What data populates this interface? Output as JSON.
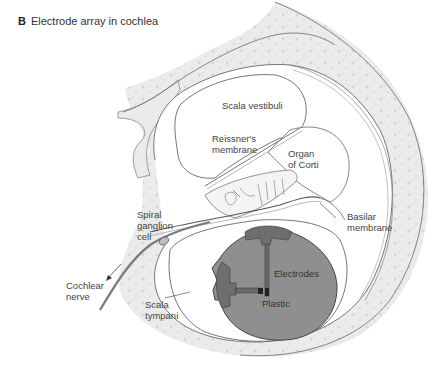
{
  "figure": {
    "panel_letter": "B",
    "title": "Electrode array in cochlea"
  },
  "labels": {
    "scala_vestibuli": "Scala vestibuli",
    "reissners_membrane_1": "Reissner's",
    "reissners_membrane_2": "membrane",
    "organ_of_corti_1": "Organ",
    "organ_of_corti_2": "of Corti",
    "spiral_ganglion_1": "Spiral",
    "spiral_ganglion_2": "ganglion",
    "spiral_ganglion_3": "cell",
    "basilar_membrane_1": "Basilar",
    "basilar_membrane_2": "membrane",
    "electrodes": "Electrodes",
    "cochlear_nerve_1": "Cochlear",
    "cochlear_nerve_2": "nerve",
    "scala_tympani_1": "Scala",
    "scala_tympani_2": "tympani",
    "plastic": "Plastic"
  },
  "colors": {
    "bone": "#ececec",
    "outline": "#666666",
    "plastic": "#8f8f8f",
    "electrode": "#6e6e6e",
    "nerve": "#777777"
  }
}
